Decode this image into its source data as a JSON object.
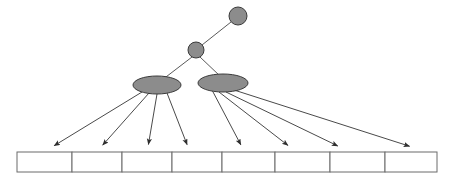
{
  "diagram": {
    "type": "tree",
    "canvas": {
      "width": 455,
      "height": 183,
      "background": "#ffffff"
    },
    "style": {
      "node_fill": "#8c8c8c",
      "node_stroke": "#3a3a3a",
      "edge_color": "#5a5a5a",
      "pointer_color": "#4a4a4a",
      "cell_fill": "#ffffff",
      "cell_stroke": "#6b6b6b"
    },
    "levels": [
      {
        "name": "root-level",
        "label": "",
        "node_count": 1
      },
      {
        "name": "internal-level",
        "label": "",
        "node_count": 1
      },
      {
        "name": "directory-level",
        "label": "",
        "node_count": 2
      },
      {
        "name": "leaf-level",
        "label": "",
        "node_count": 8
      }
    ],
    "circle_nodes": [
      {
        "id": "root-node",
        "label": "",
        "cx": 238,
        "cy": 16,
        "r": 9
      },
      {
        "id": "internal-node",
        "label": "",
        "cx": 196,
        "cy": 50,
        "r": 8
      }
    ],
    "ellipse_nodes": [
      {
        "id": "directory-node-left",
        "label": "",
        "cx": 157,
        "cy": 85,
        "rx": 24,
        "ry": 9
      },
      {
        "id": "directory-node-right",
        "label": "",
        "cx": 223,
        "cy": 83,
        "rx": 25,
        "ry": 9
      }
    ],
    "tree_edges": [
      {
        "id": "edge-root-internal",
        "from": "root-node",
        "to": "internal-node",
        "x1": 231,
        "y1": 22,
        "x2": 202,
        "y2": 45
      },
      {
        "id": "edge-internal-left",
        "from": "internal-node",
        "to": "directory-node-left",
        "x1": 192,
        "y1": 57,
        "x2": 162,
        "y2": 80
      },
      {
        "id": "edge-internal-right",
        "from": "internal-node",
        "to": "directory-node-right",
        "x1": 200,
        "y1": 57,
        "x2": 220,
        "y2": 76
      }
    ],
    "leaf_row": {
      "id": "leaf-array",
      "x": 17,
      "y": 152,
      "width": 420,
      "height": 20,
      "cell_count": 8,
      "dividers": [
        72,
        122,
        172,
        222,
        275,
        330,
        385
      ],
      "cells": [
        {
          "index": 0,
          "label": "",
          "x": 17,
          "width": 55
        },
        {
          "index": 1,
          "label": "",
          "x": 72,
          "width": 50
        },
        {
          "index": 2,
          "label": "",
          "x": 122,
          "width": 50
        },
        {
          "index": 3,
          "label": "",
          "x": 172,
          "width": 50
        },
        {
          "index": 4,
          "label": "",
          "x": 222,
          "width": 53
        },
        {
          "index": 5,
          "label": "",
          "x": 275,
          "width": 55
        },
        {
          "index": 6,
          "label": "",
          "x": 330,
          "width": 55
        },
        {
          "index": 7,
          "label": "",
          "x": 385,
          "width": 52
        }
      ]
    },
    "pointers": [
      {
        "id": "pointer-left-1",
        "from": "directory-node-left",
        "to_cell": 0,
        "x1": 142,
        "y1": 92,
        "x2": 52,
        "y2": 147
      },
      {
        "id": "pointer-left-2",
        "from": "directory-node-left",
        "to_cell": 1,
        "x1": 149,
        "y1": 93,
        "x2": 101,
        "y2": 147
      },
      {
        "id": "pointer-left-3",
        "from": "directory-node-left",
        "to_cell": 2,
        "x1": 157,
        "y1": 94,
        "x2": 148,
        "y2": 147
      },
      {
        "id": "pointer-left-4",
        "from": "directory-node-left",
        "to_cell": 3,
        "x1": 167,
        "y1": 93,
        "x2": 188,
        "y2": 147
      },
      {
        "id": "pointer-right-1",
        "from": "directory-node-right",
        "to_cell": 4,
        "x1": 212,
        "y1": 90,
        "x2": 242,
        "y2": 147
      },
      {
        "id": "pointer-right-2",
        "from": "directory-node-right",
        "to_cell": 5,
        "x1": 219,
        "y1": 92,
        "x2": 290,
        "y2": 147
      },
      {
        "id": "pointer-right-3",
        "from": "directory-node-right",
        "to_cell": 6,
        "x1": 226,
        "y1": 92,
        "x2": 340,
        "y2": 147
      },
      {
        "id": "pointer-right-4",
        "from": "directory-node-right",
        "to_cell": 7,
        "x1": 234,
        "y1": 90,
        "x2": 412,
        "y2": 147
      }
    ],
    "labels": []
  }
}
